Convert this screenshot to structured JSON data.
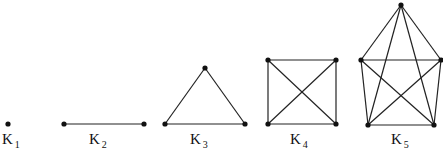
{
  "diagram": {
    "edge_color": "#222222",
    "graphs": [
      {
        "name": "K",
        "sub": "1",
        "label_x": 2,
        "label_y": 131,
        "nodes": [
          [
            8,
            124
          ]
        ],
        "edges": []
      },
      {
        "name": "K",
        "sub": "2",
        "label_x": 89,
        "label_y": 131,
        "nodes": [
          [
            64,
            124
          ],
          [
            144,
            124
          ]
        ],
        "edges": [
          [
            0,
            1
          ]
        ]
      },
      {
        "name": "K",
        "sub": "3",
        "label_x": 190,
        "label_y": 131,
        "nodes": [
          [
            205,
            68
          ],
          [
            165,
            124
          ],
          [
            245,
            124
          ]
        ],
        "edges": [
          [
            0,
            1
          ],
          [
            0,
            2
          ],
          [
            1,
            2
          ]
        ]
      },
      {
        "name": "K",
        "sub": "4",
        "label_x": 290,
        "label_y": 131,
        "nodes": [
          [
            268,
            60
          ],
          [
            336,
            60
          ],
          [
            268,
            124
          ],
          [
            336,
            124
          ]
        ],
        "edges": [
          [
            0,
            1
          ],
          [
            0,
            2
          ],
          [
            0,
            3
          ],
          [
            1,
            2
          ],
          [
            1,
            3
          ],
          [
            2,
            3
          ]
        ]
      },
      {
        "name": "K",
        "sub": "5",
        "label_x": 391,
        "label_y": 131,
        "nodes": [
          [
            401,
            5
          ],
          [
            361,
            60
          ],
          [
            441,
            60
          ],
          [
            368,
            125
          ],
          [
            434,
            125
          ]
        ],
        "edges": [
          [
            0,
            1
          ],
          [
            0,
            2
          ],
          [
            0,
            3
          ],
          [
            0,
            4
          ],
          [
            1,
            2
          ],
          [
            1,
            3
          ],
          [
            1,
            4
          ],
          [
            2,
            3
          ],
          [
            2,
            4
          ],
          [
            3,
            4
          ]
        ]
      }
    ]
  }
}
